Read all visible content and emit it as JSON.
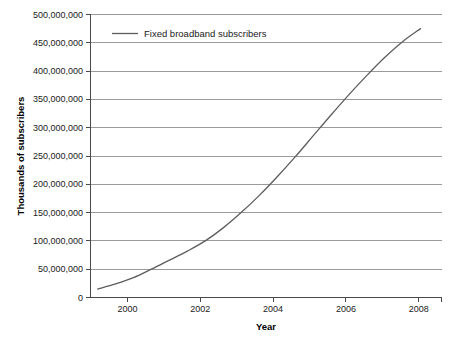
{
  "chart_data": {
    "type": "line",
    "title": "",
    "xlabel": "Year",
    "ylabel": "Thousands of subscribers",
    "xlim": [
      1998.8,
      2008.6
    ],
    "ylim": [
      0,
      500000000
    ],
    "grid": true,
    "legend_position": "top-left-inside",
    "x_tick_labels": [
      "2000",
      "2002",
      "2004",
      "2006",
      "2008"
    ],
    "x_ticks": [
      2000,
      2002,
      2004,
      2006,
      2008
    ],
    "y_tick_labels": [
      "0",
      "50,000,000",
      "100,000,000",
      "150,000,000",
      "200,000,000",
      "250,000,000",
      "300,000,000",
      "350,000,000",
      "400,000,000",
      "450,000,000",
      "500,000,000"
    ],
    "y_ticks": [
      0,
      50000000,
      100000000,
      150000000,
      200000000,
      250000000,
      300000000,
      350000000,
      400000000,
      450000000,
      500000000
    ],
    "series": [
      {
        "name": "Fixed broadband subscribers",
        "color": "#5d5d5d",
        "x": [
          1999,
          1999.5,
          2000,
          2000.5,
          2001,
          2001.5,
          2002,
          2002.5,
          2003,
          2003.5,
          2004,
          2004.5,
          2005,
          2005.5,
          2006,
          2006.5,
          2007,
          2007.5,
          2008
        ],
        "values": [
          15000000,
          24000000,
          35000000,
          50000000,
          66000000,
          82000000,
          100000000,
          123000000,
          150000000,
          180000000,
          213000000,
          248000000,
          285000000,
          322000000,
          358000000,
          392000000,
          424000000,
          452000000,
          475000000
        ]
      }
    ],
    "legend_entries": [
      "Fixed broadband subscribers"
    ]
  }
}
